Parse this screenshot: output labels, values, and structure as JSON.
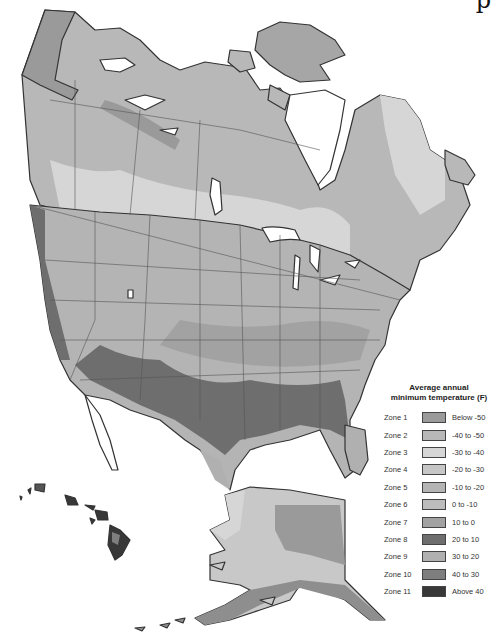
{
  "map": {
    "subject": "Plant hardiness zones of North America",
    "regions": [
      "Canada",
      "Contiguous United States",
      "Alaska",
      "Hawaii",
      "Northern Mexico"
    ],
    "colors": {
      "zone1": "#9a9a9a",
      "zone2": "#b8b8b8",
      "zone3": "#d6d6d6",
      "zone4": "#c6c6c6",
      "zone5": "#b4b4b4",
      "zone6": "#bcbcbc",
      "zone7": "#a2a2a2",
      "zone8": "#6e6e6e",
      "zone9": "#b0b0b0",
      "zone10": "#7e7e7e",
      "zone11": "#383838",
      "water": "#ffffff",
      "border": "#333333"
    }
  },
  "corner_glyph": "p",
  "legend": {
    "title_line1": "Average annual",
    "title_line2": "minimum temperature (F)",
    "items": [
      {
        "zone": "Zone 1",
        "range": "Below -50",
        "color": "#9a9a9a"
      },
      {
        "zone": "Zone 2",
        "range": "-40 to -50",
        "color": "#b8b8b8"
      },
      {
        "zone": "Zone 3",
        "range": "-30 to -40",
        "color": "#d6d6d6"
      },
      {
        "zone": "Zone 4",
        "range": "-20 to -30",
        "color": "#c6c6c6"
      },
      {
        "zone": "Zone 5",
        "range": "-10 to -20",
        "color": "#b4b4b4"
      },
      {
        "zone": "Zone 6",
        "range": "0 to -10",
        "color": "#bcbcbc"
      },
      {
        "zone": "Zone 7",
        "range": "10 to 0",
        "color": "#a2a2a2"
      },
      {
        "zone": "Zone 8",
        "range": "20 to 10",
        "color": "#6e6e6e"
      },
      {
        "zone": "Zone 9",
        "range": "30 to 20",
        "color": "#b0b0b0"
      },
      {
        "zone": "Zone 10",
        "range": "40 to 30",
        "color": "#7e7e7e"
      },
      {
        "zone": "Zone 11",
        "range": "Above 40",
        "color": "#383838"
      }
    ]
  }
}
